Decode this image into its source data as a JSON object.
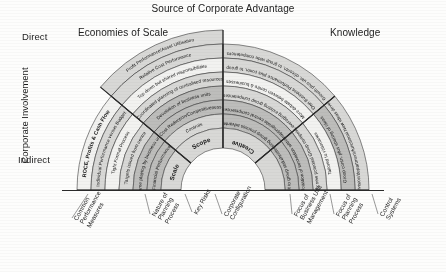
{
  "title": "Source of Corporate Advantage",
  "headers": {
    "left": "Economies of Scale",
    "right": "Knowledge"
  },
  "y_axis": {
    "label": "Corporate Involvement",
    "top": "Direct",
    "bottom": "Indirect"
  },
  "colors": {
    "ring_light": "#f2f2f0",
    "ring_mid": "#d8d8d6",
    "ring_dark": "#bdbdbb",
    "ring_darker": "#a9a9a7",
    "stroke": "#3a3a3a",
    "text": "#141414"
  },
  "sectors": [
    {
      "name": "scale",
      "hub": "Scale",
      "rings": [
        "ROCE, Profits & Cash Flow",
        "Individual Performance versus Budget",
        "Tight Formal Process",
        "Targets issued from centre",
        "Game playing by business units",
        "Financial Performance"
      ]
    },
    {
      "name": "scope",
      "hub": "Scope",
      "rings": [
        "Profit Performance/Asset Utilisation",
        "Relative Cost Performance",
        "Top down but shared responsibilities",
        "Coordinated planning of centralised resources",
        "Devolution of business units",
        "Cost Reduction/Competitiveness",
        "Controls"
      ]
    },
    {
      "name": "knowledge",
      "hub": "Creative",
      "rings": [
        "Growth plus utn. of/contn. to group wide competences",
        "Own Business Performance plus contn. to group",
        "More debate between centre & businesses",
        "Leveraging existing group competences",
        "Inappropriate central competences",
        "Utilising group process advantages"
      ]
    },
    {
      "name": "creative",
      "hub": "",
      "rings": [
        "Cross division/department/functional New ideas development",
        "Group contn. plus sharing of ideas",
        "Tailored to visionaries",
        "Identify new potential Group competences",
        "No exploitation of innovation within group",
        "Fit to group stakeholders"
      ]
    }
  ],
  "bottom_labels": [
    "Common\nPerformance\nMeasures",
    "Nature of\nPlanning\nProcess",
    "Key Risks",
    "Corporate\nConfiguration",
    "Focus of\nBusiness Unit\nManagement",
    "Focus of\nPlanning\nProcess",
    "Control\nSystems"
  ]
}
